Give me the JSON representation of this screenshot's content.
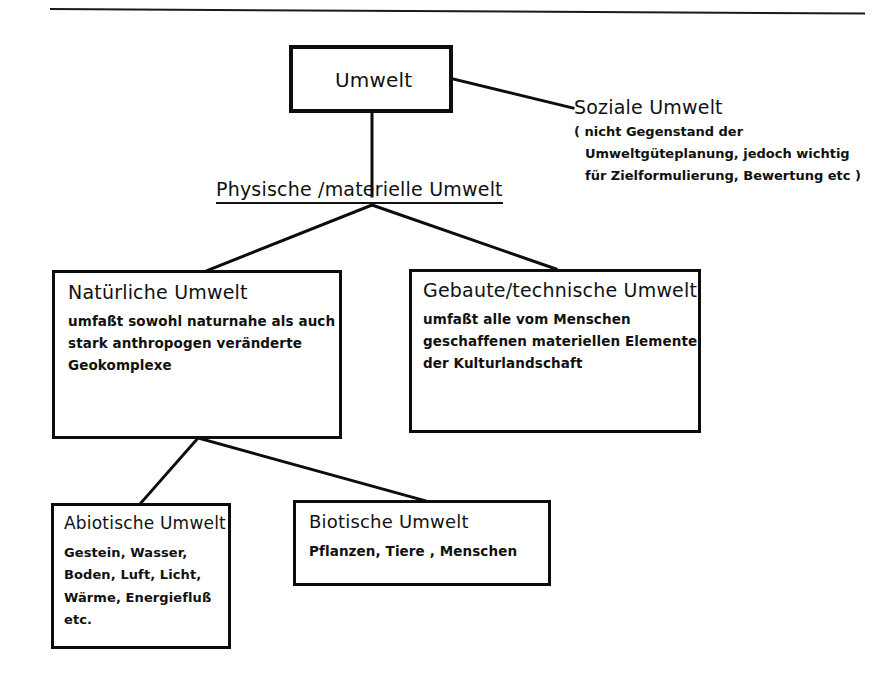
{
  "page": {
    "background_color": "#ffffff",
    "ink_color": "#0d0d0d"
  },
  "diagram": {
    "type": "hierarchy-tree",
    "root": {
      "id": "umwelt",
      "title": "Umwelt"
    },
    "side_label": {
      "id": "soziale-umwelt",
      "title": "Soziale Umwelt",
      "note_lines": [
        "( nicht Gegenstand der",
        "Umweltgüteplanung, jedoch wichtig",
        "für Zielformulierung, Bewertung etc )"
      ]
    },
    "branch_label": {
      "id": "physische-materielle-umwelt",
      "text": "Physische /materielle Umwelt",
      "underlined": true
    },
    "level2": [
      {
        "id": "natuerliche-umwelt",
        "title": "Natürliche Umwelt",
        "lines": [
          "umfaßt sowohl naturnahe als auch",
          "stark anthropogen veränderte",
          "Geokomplexe"
        ]
      },
      {
        "id": "gebaute-technische-umwelt",
        "title": "Gebaute/technische Umwelt",
        "lines": [
          "umfaßt alle vom Menschen",
          "geschaffenen materiellen Elemente",
          "der Kulturlandschaft"
        ]
      }
    ],
    "level3": [
      {
        "id": "abiotische-umwelt",
        "title": "Abiotische Umwelt",
        "lines": [
          "Gestein, Wasser,",
          "Boden, Luft, Licht,",
          "Wärme, Energiefluß",
          "etc."
        ]
      },
      {
        "id": "biotische-umwelt",
        "title": "Biotische Umwelt",
        "lines": [
          "Pflanzen, Tiere , Menschen"
        ]
      }
    ]
  }
}
